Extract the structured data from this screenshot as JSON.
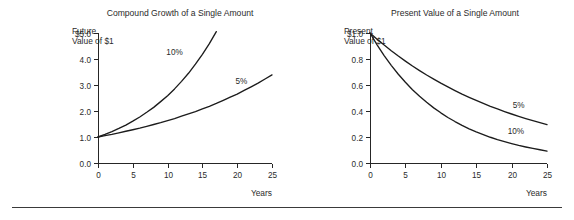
{
  "figure": {
    "background_color": "#ffffff",
    "line_color": "#1c1c1c",
    "text_color": "#2b2b2b",
    "footer_rule": {
      "name": "horizontal-rule",
      "color": "#3a3a3a"
    }
  },
  "chart_data": [
    {
      "type": "line",
      "id": "compound-growth",
      "title": "Compound Growth of a Single Amount",
      "xlabel": "Years",
      "ylabel_line1": "Future",
      "ylabel_line2": "Value of $1",
      "xlim": [
        0,
        25
      ],
      "ylim": [
        0.0,
        5.0
      ],
      "grid": false,
      "xticks": [
        0,
        5,
        10,
        15,
        20,
        25
      ],
      "xtick_labels": [
        "0",
        "5",
        "10",
        "15",
        "20",
        "25"
      ],
      "yticks": [
        0.0,
        1.0,
        2.0,
        3.0,
        4.0,
        5.0
      ],
      "ytick_labels": [
        "0.0",
        "1.0",
        "2.0",
        "3.0",
        "4.0",
        "$5.0"
      ],
      "legend_position": "inline-annotation",
      "series": [
        {
          "name": "10%",
          "label": "10%",
          "label_x": 11.0,
          "label_y": 4.15,
          "x": [
            0,
            1,
            2,
            3,
            4,
            5,
            6,
            7,
            8,
            9,
            10,
            11,
            12,
            13,
            14,
            15,
            16,
            17
          ],
          "values": [
            1.0,
            1.1,
            1.21,
            1.33,
            1.46,
            1.61,
            1.77,
            1.95,
            2.14,
            2.36,
            2.59,
            2.85,
            3.14,
            3.45,
            3.8,
            4.18,
            4.59,
            5.05
          ]
        },
        {
          "name": "5%",
          "label": "5%",
          "label_x": 20.6,
          "label_y": 3.05,
          "x": [
            0,
            1,
            2,
            3,
            4,
            5,
            6,
            7,
            8,
            9,
            10,
            11,
            12,
            13,
            14,
            15,
            16,
            17,
            18,
            19,
            20,
            21,
            22,
            23,
            24,
            25
          ],
          "values": [
            1.0,
            1.05,
            1.1,
            1.16,
            1.22,
            1.28,
            1.34,
            1.41,
            1.48,
            1.55,
            1.63,
            1.71,
            1.8,
            1.89,
            1.98,
            2.08,
            2.18,
            2.29,
            2.41,
            2.53,
            2.65,
            2.79,
            2.93,
            3.07,
            3.23,
            3.39
          ]
        }
      ]
    },
    {
      "type": "line",
      "id": "present-value",
      "title": "Present Value of a Single Amount",
      "xlabel": "Years",
      "ylabel_line1": "Present",
      "ylabel_line2": "Value of $1",
      "xlim": [
        0,
        25
      ],
      "ylim": [
        0.0,
        1.0
      ],
      "grid": false,
      "xticks": [
        0,
        5,
        10,
        15,
        20,
        25
      ],
      "xtick_labels": [
        "0",
        "5",
        "10",
        "15",
        "20",
        "25"
      ],
      "yticks": [
        0.0,
        0.2,
        0.4,
        0.6,
        0.8,
        1.0
      ],
      "ytick_labels": [
        "0.0",
        "0.2",
        "0.4",
        "0.6",
        "0.8",
        "$1.0"
      ],
      "legend_position": "inline-annotation",
      "series": [
        {
          "name": "5%",
          "label": "5%",
          "label_x": 21.0,
          "label_y": 0.42,
          "x": [
            0,
            1,
            2,
            3,
            4,
            5,
            6,
            7,
            8,
            9,
            10,
            11,
            12,
            13,
            14,
            15,
            16,
            17,
            18,
            19,
            20,
            21,
            22,
            23,
            24,
            25
          ],
          "values": [
            1.0,
            0.952,
            0.907,
            0.864,
            0.823,
            0.784,
            0.746,
            0.711,
            0.677,
            0.645,
            0.614,
            0.585,
            0.557,
            0.53,
            0.505,
            0.481,
            0.458,
            0.436,
            0.416,
            0.396,
            0.377,
            0.359,
            0.342,
            0.326,
            0.31,
            0.295
          ]
        },
        {
          "name": "10%",
          "label": "10%",
          "label_x": 20.6,
          "label_y": 0.22,
          "x": [
            0,
            1,
            2,
            3,
            4,
            5,
            6,
            7,
            8,
            9,
            10,
            11,
            12,
            13,
            14,
            15,
            16,
            17,
            18,
            19,
            20,
            21,
            22,
            23,
            24,
            25
          ],
          "values": [
            1.0,
            0.909,
            0.826,
            0.751,
            0.683,
            0.621,
            0.564,
            0.513,
            0.467,
            0.424,
            0.386,
            0.35,
            0.319,
            0.29,
            0.263,
            0.239,
            0.218,
            0.198,
            0.18,
            0.164,
            0.149,
            0.135,
            0.123,
            0.112,
            0.102,
            0.092
          ]
        }
      ]
    }
  ]
}
